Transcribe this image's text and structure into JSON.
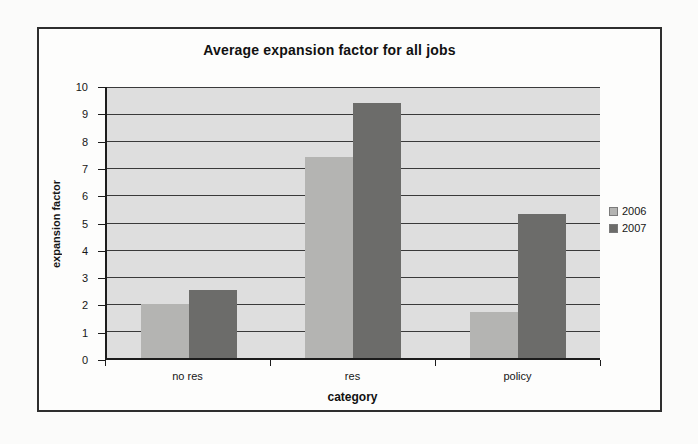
{
  "figure": {
    "frame_border_color": "#2e2e2e",
    "page_background": "#fbfbfa"
  },
  "chart_data": {
    "type": "bar",
    "title": "Average expansion factor for all jobs",
    "xlabel": "category",
    "ylabel": "expansion factor",
    "categories": [
      "no res",
      "res",
      "policy"
    ],
    "series": [
      {
        "name": "2006",
        "color": "#b4b4b2",
        "values": [
          2.0,
          7.4,
          1.7
        ]
      },
      {
        "name": "2007",
        "color": "#6c6c6a",
        "values": [
          2.5,
          9.4,
          5.3
        ]
      }
    ],
    "ylim": [
      0,
      10
    ],
    "yticks": [
      0,
      1,
      2,
      3,
      4,
      5,
      6,
      7,
      8,
      9,
      10
    ],
    "grid": true,
    "legend_position": "right",
    "plot_background": "#dedede",
    "gridline_color": "#3a3a3a",
    "axis_color": "#1c1c1c"
  }
}
